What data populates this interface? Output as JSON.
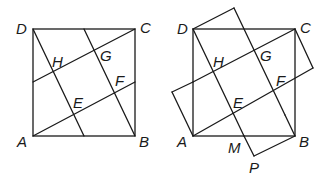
{
  "figures": [
    {
      "name": "left-figure",
      "labels": {
        "D": "D",
        "C": "C",
        "B": "B",
        "A": "A",
        "H": "H",
        "G": "G",
        "F": "F",
        "E": "E"
      }
    },
    {
      "name": "right-figure",
      "labels": {
        "D": "D",
        "C": "C",
        "B": "B",
        "A": "A",
        "H": "H",
        "G": "G",
        "F": "F",
        "E": "E",
        "M": "M",
        "P": "P"
      }
    }
  ]
}
